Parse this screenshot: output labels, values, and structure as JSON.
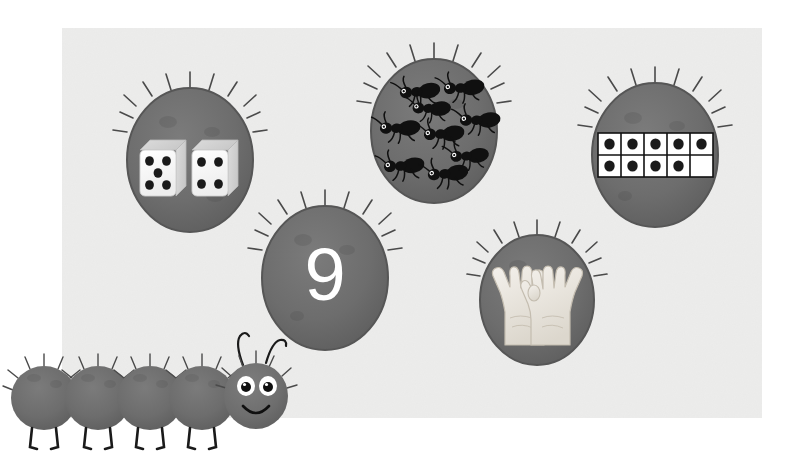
{
  "poster": {
    "title": "Number 9 representations",
    "target_number": 9,
    "background_color": "#ffffff",
    "panel_color": "#ececeb",
    "bubble_color": "#6e6e6e",
    "bubble_color_dark": "#5f5f5f",
    "bubble_outline": "#565656",
    "hair_color": "#4a4a4a",
    "ink_color": "#1a1a1a",
    "white": "#ffffff"
  },
  "bubbles": [
    {
      "id": "dice-bubble",
      "name": "dice-representation",
      "label": "dice",
      "cx": 190,
      "cy": 160,
      "rx": 63,
      "ry": 72,
      "value": 9,
      "dice": [
        {
          "name": "die-five",
          "pips": 5
        },
        {
          "name": "die-four",
          "pips": 4
        }
      ]
    },
    {
      "id": "ants-bubble",
      "name": "ants-representation",
      "label": "ants",
      "cx": 434,
      "cy": 131,
      "rx": 63,
      "ry": 72,
      "value": 9,
      "ant_count": 9,
      "ants": [
        {
          "x": -22,
          "y": -38,
          "rot": -14
        },
        {
          "x": 22,
          "y": -42,
          "rot": -12
        },
        {
          "x": -42,
          "y": -2,
          "rot": -10
        },
        {
          "x": 2,
          "y": 4,
          "rot": -12
        },
        {
          "x": 40,
          "y": -10,
          "rot": -10
        },
        {
          "x": -36,
          "y": 36,
          "rot": -12
        },
        {
          "x": 8,
          "y": 44,
          "rot": -14
        },
        {
          "x": -4,
          "y": -22,
          "rot": -8
        },
        {
          "x": 34,
          "y": 26,
          "rot": -12
        }
      ]
    },
    {
      "id": "tenframe-bubble",
      "name": "ten-frame-representation",
      "label": "ten frame",
      "cx": 655,
      "cy": 155,
      "rx": 63,
      "ry": 72,
      "value": 9,
      "ten_frame": {
        "columns": 5,
        "rows": 2,
        "filled": 9,
        "empty": 1,
        "top_row": [
          true,
          true,
          true,
          true,
          true
        ],
        "bottom_row": [
          true,
          true,
          true,
          true,
          false
        ]
      }
    },
    {
      "id": "numeral-bubble",
      "name": "numeral-representation",
      "label": "numeral",
      "cx": 325,
      "cy": 278,
      "rx": 63,
      "ry": 72,
      "value": 9,
      "numeral_text": "9"
    },
    {
      "id": "hands-bubble",
      "name": "hands-representation",
      "label": "hands",
      "cx": 537,
      "cy": 300,
      "rx": 57,
      "ry": 65,
      "value": 9,
      "hands": [
        {
          "name": "left-hand",
          "fingers_up": 5
        },
        {
          "name": "right-hand",
          "fingers_up": 4
        }
      ]
    }
  ],
  "caterpillar": {
    "name": "caterpillar-mascot",
    "segment_count": 4,
    "has_head": true,
    "antennae": 2,
    "eyes": 2,
    "segments": [
      {
        "cx": 44,
        "cy": 398,
        "rx": 33,
        "ry": 32
      },
      {
        "cx": 98,
        "cy": 398,
        "rx": 33,
        "ry": 32
      },
      {
        "cx": 150,
        "cy": 398,
        "rx": 33,
        "ry": 32
      },
      {
        "cx": 202,
        "cy": 398,
        "rx": 33,
        "ry": 32
      }
    ],
    "head": {
      "cx": 256,
      "cy": 396,
      "rx": 32,
      "ry": 33
    }
  }
}
